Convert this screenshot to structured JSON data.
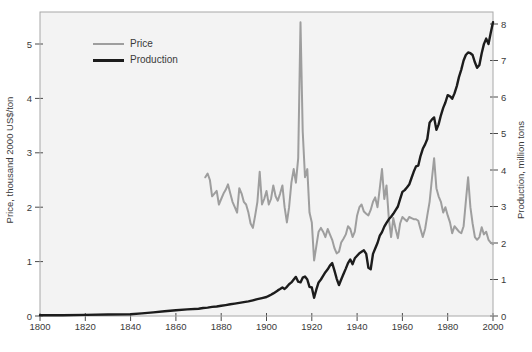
{
  "chart_data": {
    "type": "line",
    "x_axis": {
      "range": [
        1800,
        2000
      ],
      "ticks": [
        1800,
        1820,
        1840,
        1860,
        1880,
        1900,
        1920,
        1940,
        1960,
        1980,
        2000
      ]
    },
    "left_axis": {
      "label": "Price, thousand 2000 US$/ton",
      "range": [
        0,
        5.59
      ],
      "ticks": [
        0,
        1,
        2,
        3,
        4,
        5
      ]
    },
    "right_axis": {
      "label": "Production, million tons",
      "range": [
        0,
        8.33
      ],
      "ticks": [
        0,
        1,
        2,
        3,
        4,
        5,
        6,
        7,
        8
      ]
    },
    "legend": [
      {
        "label": "Price",
        "color": "#9e9e9e"
      },
      {
        "label": "Production",
        "color": "#1c1c1c"
      }
    ],
    "grid": false,
    "panel_color": "#f3f3f3",
    "frame_color": "#a8a8a8",
    "tick_color": "#4a4a4a",
    "text_color": "#3a3a3a",
    "series": [
      {
        "name": "Price",
        "axis": "left",
        "color": "#9e9e9e",
        "stroke_width": 2,
        "points": [
          [
            1873,
            2.55
          ],
          [
            1874,
            2.62
          ],
          [
            1875,
            2.5
          ],
          [
            1876,
            2.2
          ],
          [
            1877,
            2.25
          ],
          [
            1878,
            2.3
          ],
          [
            1879,
            2.05
          ],
          [
            1880,
            2.15
          ],
          [
            1881,
            2.25
          ],
          [
            1882,
            2.32
          ],
          [
            1883,
            2.42
          ],
          [
            1884,
            2.25
          ],
          [
            1885,
            2.1
          ],
          [
            1886,
            2.0
          ],
          [
            1887,
            1.9
          ],
          [
            1888,
            2.35
          ],
          [
            1889,
            2.25
          ],
          [
            1890,
            2.1
          ],
          [
            1891,
            2.05
          ],
          [
            1892,
            1.9
          ],
          [
            1893,
            1.7
          ],
          [
            1894,
            1.62
          ],
          [
            1895,
            1.85
          ],
          [
            1896,
            2.1
          ],
          [
            1897,
            2.65
          ],
          [
            1898,
            2.05
          ],
          [
            1899,
            2.15
          ],
          [
            1900,
            2.3
          ],
          [
            1901,
            2.05
          ],
          [
            1902,
            2.15
          ],
          [
            1903,
            2.4
          ],
          [
            1904,
            2.2
          ],
          [
            1905,
            2.12
          ],
          [
            1906,
            2.25
          ],
          [
            1907,
            2.4
          ],
          [
            1908,
            2.0
          ],
          [
            1909,
            1.72
          ],
          [
            1910,
            2.0
          ],
          [
            1911,
            2.45
          ],
          [
            1912,
            2.7
          ],
          [
            1913,
            2.45
          ],
          [
            1914,
            2.9
          ],
          [
            1915,
            5.4
          ],
          [
            1916,
            3.4
          ],
          [
            1917,
            2.55
          ],
          [
            1918,
            2.7
          ],
          [
            1919,
            1.9
          ],
          [
            1920,
            1.72
          ],
          [
            1921,
            1.02
          ],
          [
            1922,
            1.28
          ],
          [
            1923,
            1.55
          ],
          [
            1924,
            1.62
          ],
          [
            1925,
            1.55
          ],
          [
            1926,
            1.45
          ],
          [
            1927,
            1.6
          ],
          [
            1928,
            1.5
          ],
          [
            1929,
            1.4
          ],
          [
            1930,
            1.25
          ],
          [
            1931,
            1.15
          ],
          [
            1932,
            1.18
          ],
          [
            1933,
            1.35
          ],
          [
            1934,
            1.42
          ],
          [
            1935,
            1.5
          ],
          [
            1936,
            1.65
          ],
          [
            1937,
            1.6
          ],
          [
            1938,
            1.45
          ],
          [
            1939,
            1.55
          ],
          [
            1940,
            1.85
          ],
          [
            1941,
            2.0
          ],
          [
            1942,
            2.05
          ],
          [
            1943,
            1.92
          ],
          [
            1944,
            1.88
          ],
          [
            1945,
            1.85
          ],
          [
            1946,
            1.95
          ],
          [
            1947,
            2.1
          ],
          [
            1948,
            2.18
          ],
          [
            1949,
            2.0
          ],
          [
            1950,
            2.35
          ],
          [
            1951,
            2.7
          ],
          [
            1952,
            2.15
          ],
          [
            1953,
            2.4
          ],
          [
            1954,
            1.8
          ],
          [
            1955,
            1.45
          ],
          [
            1956,
            1.8
          ],
          [
            1957,
            1.6
          ],
          [
            1958,
            1.43
          ],
          [
            1959,
            1.7
          ],
          [
            1960,
            1.82
          ],
          [
            1961,
            1.78
          ],
          [
            1962,
            1.74
          ],
          [
            1963,
            1.82
          ],
          [
            1964,
            1.8
          ],
          [
            1965,
            1.78
          ],
          [
            1966,
            1.78
          ],
          [
            1967,
            1.75
          ],
          [
            1968,
            1.6
          ],
          [
            1969,
            1.45
          ],
          [
            1970,
            1.6
          ],
          [
            1971,
            1.85
          ],
          [
            1972,
            2.1
          ],
          [
            1973,
            2.5
          ],
          [
            1974,
            2.9
          ],
          [
            1975,
            2.35
          ],
          [
            1976,
            2.2
          ],
          [
            1977,
            2.1
          ],
          [
            1978,
            1.9
          ],
          [
            1979,
            2.0
          ],
          [
            1980,
            1.85
          ],
          [
            1981,
            1.72
          ],
          [
            1982,
            1.52
          ],
          [
            1983,
            1.65
          ],
          [
            1984,
            1.6
          ],
          [
            1985,
            1.55
          ],
          [
            1986,
            1.52
          ],
          [
            1987,
            1.65
          ],
          [
            1988,
            2.1
          ],
          [
            1989,
            2.55
          ],
          [
            1990,
            2.0
          ],
          [
            1991,
            1.7
          ],
          [
            1992,
            1.45
          ],
          [
            1993,
            1.4
          ],
          [
            1994,
            1.45
          ],
          [
            1995,
            1.63
          ],
          [
            1996,
            1.5
          ],
          [
            1997,
            1.55
          ],
          [
            1998,
            1.4
          ],
          [
            1999,
            1.35
          ],
          [
            2000,
            1.32
          ]
        ]
      },
      {
        "name": "Production",
        "axis": "right",
        "color": "#1c1c1c",
        "stroke_width": 2.4,
        "points": [
          [
            1800,
            0.02
          ],
          [
            1810,
            0.02
          ],
          [
            1820,
            0.03
          ],
          [
            1830,
            0.04
          ],
          [
            1840,
            0.05
          ],
          [
            1845,
            0.07
          ],
          [
            1850,
            0.1
          ],
          [
            1855,
            0.13
          ],
          [
            1860,
            0.16
          ],
          [
            1865,
            0.18
          ],
          [
            1870,
            0.2
          ],
          [
            1872,
            0.22
          ],
          [
            1874,
            0.23
          ],
          [
            1876,
            0.25
          ],
          [
            1878,
            0.26
          ],
          [
            1880,
            0.28
          ],
          [
            1882,
            0.3
          ],
          [
            1884,
            0.32
          ],
          [
            1886,
            0.34
          ],
          [
            1888,
            0.36
          ],
          [
            1890,
            0.38
          ],
          [
            1892,
            0.4
          ],
          [
            1894,
            0.43
          ],
          [
            1896,
            0.46
          ],
          [
            1898,
            0.49
          ],
          [
            1900,
            0.52
          ],
          [
            1901,
            0.55
          ],
          [
            1902,
            0.58
          ],
          [
            1903,
            0.62
          ],
          [
            1904,
            0.66
          ],
          [
            1905,
            0.7
          ],
          [
            1906,
            0.74
          ],
          [
            1907,
            0.78
          ],
          [
            1908,
            0.74
          ],
          [
            1909,
            0.8
          ],
          [
            1910,
            0.87
          ],
          [
            1911,
            0.92
          ],
          [
            1912,
            1.0
          ],
          [
            1913,
            1.07
          ],
          [
            1914,
            0.94
          ],
          [
            1915,
            0.92
          ],
          [
            1916,
            1.05
          ],
          [
            1917,
            1.08
          ],
          [
            1918,
            1.0
          ],
          [
            1919,
            0.8
          ],
          [
            1920,
            0.78
          ],
          [
            1921,
            0.5
          ],
          [
            1922,
            0.72
          ],
          [
            1923,
            0.92
          ],
          [
            1924,
            1.0
          ],
          [
            1925,
            1.1
          ],
          [
            1926,
            1.2
          ],
          [
            1927,
            1.28
          ],
          [
            1928,
            1.38
          ],
          [
            1929,
            1.45
          ],
          [
            1930,
            1.25
          ],
          [
            1931,
            1.02
          ],
          [
            1932,
            0.85
          ],
          [
            1933,
            1.0
          ],
          [
            1934,
            1.15
          ],
          [
            1935,
            1.3
          ],
          [
            1936,
            1.45
          ],
          [
            1937,
            1.55
          ],
          [
            1938,
            1.42
          ],
          [
            1939,
            1.58
          ],
          [
            1940,
            1.65
          ],
          [
            1941,
            1.72
          ],
          [
            1942,
            1.76
          ],
          [
            1943,
            1.8
          ],
          [
            1944,
            1.7
          ],
          [
            1945,
            1.32
          ],
          [
            1946,
            1.28
          ],
          [
            1947,
            1.7
          ],
          [
            1948,
            1.85
          ],
          [
            1949,
            2.0
          ],
          [
            1950,
            2.2
          ],
          [
            1951,
            2.3
          ],
          [
            1952,
            2.45
          ],
          [
            1953,
            2.55
          ],
          [
            1954,
            2.65
          ],
          [
            1955,
            2.72
          ],
          [
            1956,
            2.8
          ],
          [
            1957,
            2.9
          ],
          [
            1958,
            3.0
          ],
          [
            1959,
            3.2
          ],
          [
            1960,
            3.4
          ],
          [
            1961,
            3.45
          ],
          [
            1962,
            3.52
          ],
          [
            1963,
            3.6
          ],
          [
            1964,
            3.78
          ],
          [
            1965,
            3.95
          ],
          [
            1966,
            4.1
          ],
          [
            1967,
            4.12
          ],
          [
            1968,
            4.38
          ],
          [
            1969,
            4.58
          ],
          [
            1970,
            4.7
          ],
          [
            1971,
            4.85
          ],
          [
            1972,
            5.3
          ],
          [
            1973,
            5.38
          ],
          [
            1974,
            5.44
          ],
          [
            1975,
            5.1
          ],
          [
            1976,
            5.25
          ],
          [
            1977,
            5.5
          ],
          [
            1978,
            5.7
          ],
          [
            1979,
            5.85
          ],
          [
            1980,
            6.05
          ],
          [
            1981,
            6.02
          ],
          [
            1982,
            5.95
          ],
          [
            1983,
            6.1
          ],
          [
            1984,
            6.3
          ],
          [
            1985,
            6.55
          ],
          [
            1986,
            6.75
          ],
          [
            1987,
            7.0
          ],
          [
            1988,
            7.15
          ],
          [
            1989,
            7.22
          ],
          [
            1990,
            7.2
          ],
          [
            1991,
            7.15
          ],
          [
            1992,
            6.95
          ],
          [
            1993,
            6.8
          ],
          [
            1994,
            6.88
          ],
          [
            1995,
            7.2
          ],
          [
            1996,
            7.45
          ],
          [
            1997,
            7.6
          ],
          [
            1998,
            7.45
          ],
          [
            1999,
            7.75
          ],
          [
            2000,
            8.05
          ]
        ]
      }
    ]
  }
}
